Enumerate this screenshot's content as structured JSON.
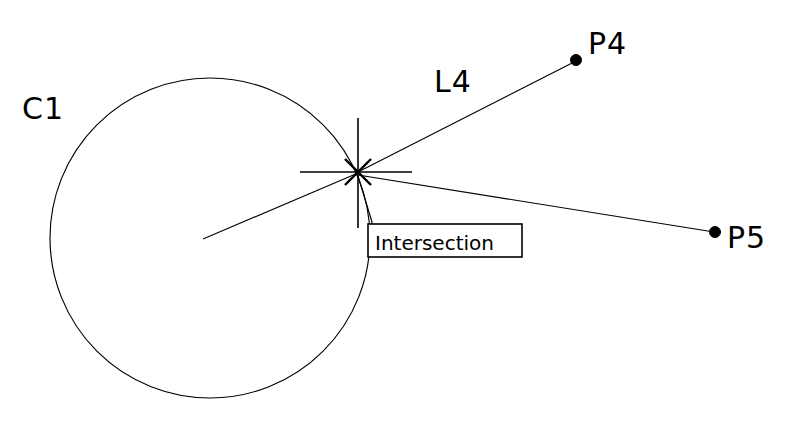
{
  "drawing": {
    "title": "CAD object snap intersection",
    "background_color": "#ffffff",
    "stroke_color": "#000000",
    "width": 808,
    "height": 422
  },
  "labels": {
    "circle": "C1",
    "line": "L4",
    "point_p4": "P4",
    "point_p5": "P5"
  },
  "tooltip": {
    "text": "Intersection"
  },
  "entities": {
    "circle": {
      "name": "C1",
      "center_x": 210,
      "center_y": 238,
      "radius": 160
    },
    "radius_line": {
      "x1": 203,
      "y1": 239,
      "x2": 358,
      "y2": 173
    },
    "line_l4": {
      "name": "L4",
      "x1": 358,
      "y1": 172,
      "x2": 576,
      "y2": 61
    },
    "line_p5": {
      "x1": 358,
      "y1": 175,
      "x2": 714,
      "y2": 232
    },
    "point_p4": {
      "name": "P4",
      "x": 576,
      "y": 60
    },
    "point_p5": {
      "name": "P5",
      "x": 715,
      "y": 232
    },
    "intersection": {
      "x": 358,
      "y": 172
    },
    "crosshair": {
      "h_x1": 300,
      "h_x2": 412,
      "h_y": 172,
      "v_y1": 118,
      "v_y2": 228,
      "v_x": 358
    },
    "tooltip_box": {
      "x": 368,
      "y": 224,
      "width": 154,
      "height": 33
    },
    "leader": {
      "x1": 358,
      "y1": 176,
      "x2": 372,
      "y2": 224
    }
  },
  "label_positions": {
    "c1": {
      "x": 22,
      "y": 119
    },
    "l4": {
      "x": 434,
      "y": 92
    },
    "p4": {
      "x": 588,
      "y": 54
    },
    "p5": {
      "x": 727,
      "y": 248
    },
    "tooltip_text": {
      "x": 375,
      "y": 250
    }
  }
}
